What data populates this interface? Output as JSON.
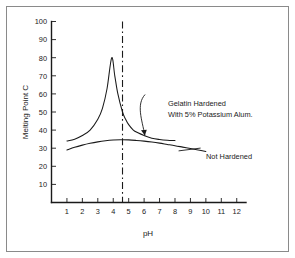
{
  "figure": {
    "background_color": "#ffffff",
    "frame_color": "#8a8a8a",
    "ink_color": "#1a1a1a"
  },
  "chart_data": {
    "type": "line",
    "title": "",
    "xlabel": "pH",
    "ylabel": "Melting Point C",
    "xlim": [
      0,
      12.6
    ],
    "ylim": [
      0,
      100
    ],
    "grid": false,
    "legend_position": "inline-annotations",
    "xticks": [
      1,
      2,
      3,
      4,
      5,
      6,
      7,
      8,
      9,
      10,
      11,
      12
    ],
    "xtick_labels": [
      "1",
      "2",
      "3",
      "4",
      "5",
      "6",
      "7",
      "8",
      "9",
      "10",
      "11",
      "12"
    ],
    "yticks": [
      10,
      20,
      30,
      40,
      50,
      60,
      70,
      80,
      90,
      100
    ],
    "ytick_labels": [
      "10",
      "20",
      "30",
      "40",
      "50",
      "60",
      "70",
      "80",
      "90",
      "100"
    ],
    "annotations": [
      {
        "name": "isoelectric-line",
        "type": "vline",
        "x": 4.6,
        "style": "dash-dot",
        "label": ""
      },
      {
        "name": "hardened-callout",
        "type": "text-with-arrow",
        "text_lines": [
          "Gelatin Hardened",
          "With 5% Potassium Alum."
        ],
        "text_x": 6.45,
        "text_y": 58,
        "arrow_target_x": 6.05,
        "arrow_target_y": 37
      },
      {
        "name": "not-hardened-callout",
        "type": "text-with-leader",
        "text_lines": [
          "Not Hardened"
        ],
        "text_x": 9.6,
        "text_y": 29,
        "leader_from_x": 9.4,
        "leader_from_y": 29.4
      }
    ],
    "series": [
      {
        "name": "Gelatin Hardened With 5% Potassium Alum.",
        "label_text": "Gelatin Hardened With 5% Potassium Alum.",
        "x": [
          1.0,
          1.5,
          2.0,
          2.5,
          3.0,
          3.3,
          3.6,
          3.9,
          4.1,
          4.3,
          4.6,
          4.8,
          5.0,
          5.3,
          5.6,
          6.0,
          6.5,
          7.0,
          7.5,
          8.0
        ],
        "values": [
          34,
          35,
          37,
          40,
          46,
          52,
          63,
          80,
          70,
          60,
          50,
          46,
          43,
          40,
          38.5,
          37,
          35.5,
          34.8,
          34.4,
          34.2
        ]
      },
      {
        "name": "Not Hardened",
        "label_text": "Not Hardened",
        "x": [
          1.0,
          1.5,
          2.0,
          2.5,
          3.0,
          3.5,
          4.0,
          4.5,
          5.0,
          5.5,
          6.0,
          6.5,
          7.0,
          7.5,
          8.0,
          8.5,
          9.0,
          9.5,
          10.0
        ],
        "values": [
          29,
          30.5,
          31.7,
          32.7,
          33.5,
          34.1,
          34.5,
          34.7,
          34.6,
          34.3,
          33.9,
          33.4,
          32.8,
          32.1,
          31.4,
          30.6,
          29.8,
          29.0,
          28.2
        ]
      }
    ]
  }
}
